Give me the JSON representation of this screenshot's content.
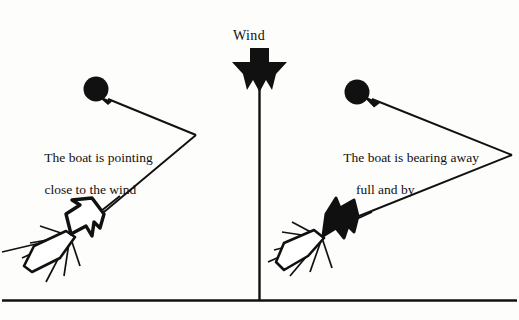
{
  "diagram": {
    "title_label": "Wind",
    "left_caption": {
      "line1": "The boat is pointing",
      "line2": "close to the wind"
    },
    "right_caption": {
      "line1": "The boat is bearing away",
      "line2": "full and by"
    },
    "colors": {
      "ink": "#111111",
      "paper": "#fdfdfb",
      "sail_filled": "#101010",
      "sail_hollow": "#ffffff"
    },
    "elements": {
      "wind_arrow": "wind-direction-arrow-down",
      "wind_axis": "wind-axis-line",
      "baseline": "baseline-rule",
      "left_mark": "left-course-mark-buoy",
      "right_mark": "right-course-mark-buoy",
      "left_course": "left-course-track-chevron",
      "right_course": "right-course-track-chevron",
      "left_boat": "left-boat-outlined-sail",
      "right_boat": "right-boat-filled-sail"
    }
  }
}
